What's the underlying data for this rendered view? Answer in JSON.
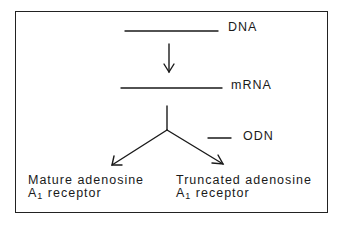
{
  "diagram": {
    "labels": {
      "dna": "DNA",
      "mrna": "mRNA",
      "odn": "ODN",
      "left_product_line1": "Mature adenosine",
      "left_product_line2_prefix": "A",
      "left_product_line2_sub": "1",
      "left_product_line2_suffix": " receptor",
      "right_product_line1": "Truncated adenosine",
      "right_product_line2_prefix": "A",
      "right_product_line2_sub": "1",
      "right_product_line2_suffix": " receptor"
    },
    "nodes": [
      "DNA",
      "mRNA",
      "Mature adenosine A1 receptor",
      "Truncated adenosine A1 receptor",
      "ODN"
    ],
    "edges": [
      {
        "from": "DNA",
        "to": "mRNA"
      },
      {
        "from": "mRNA",
        "to": "Mature adenosine A1 receptor"
      },
      {
        "from": "mRNA",
        "to": "Truncated adenosine A1 receptor"
      }
    ]
  }
}
